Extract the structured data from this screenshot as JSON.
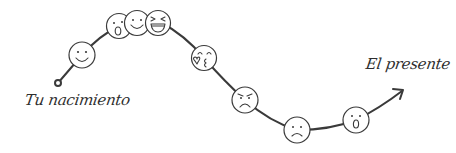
{
  "diagram": {
    "start_label": "Tu nacimiento",
    "end_label": "El presente",
    "line_color": "#3a3a3a",
    "background": "#ffffff",
    "faces": [
      {
        "order": 1,
        "emotion": "happy-smile",
        "x": 82,
        "y": 55
      },
      {
        "order": 2,
        "emotion": "surprised",
        "x": 119,
        "y": 26
      },
      {
        "order": 3,
        "emotion": "happy-smile",
        "x": 137,
        "y": 23
      },
      {
        "order": 4,
        "emotion": "laughing",
        "x": 158,
        "y": 23
      },
      {
        "order": 5,
        "emotion": "kiss-love",
        "x": 204,
        "y": 58
      },
      {
        "order": 6,
        "emotion": "angry",
        "x": 245,
        "y": 100
      },
      {
        "order": 7,
        "emotion": "sad",
        "x": 297,
        "y": 130
      },
      {
        "order": 8,
        "emotion": "surprised",
        "x": 356,
        "y": 120
      }
    ]
  }
}
